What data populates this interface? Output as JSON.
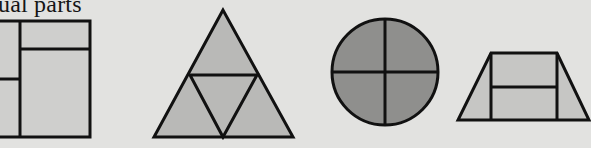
{
  "heading": {
    "text": "ual parts"
  },
  "colors": {
    "background": "#e2e2e0",
    "stroke": "#111111",
    "light_fill": "#cfcfcd",
    "triangle_fill": "#b9b9b7",
    "circle_fill": "#8f8f8d",
    "trapezoid_fill": "#c6c6c4"
  },
  "figures": [
    {
      "name": "rectangle",
      "description": "Rectangle divided into 4 unequal parts"
    },
    {
      "name": "triangle",
      "description": "Triangle divided into 4 equal triangles"
    },
    {
      "name": "circle",
      "description": "Circle divided into 4 equal quarters"
    },
    {
      "name": "trapezoid",
      "description": "Trapezoid divided into 4 unequal parts"
    }
  ]
}
